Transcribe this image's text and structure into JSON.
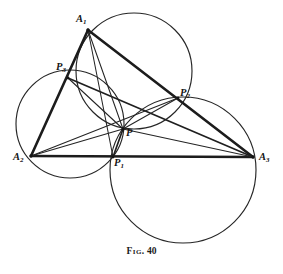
{
  "figure": {
    "caption_prefix": "Fig.",
    "caption_number": "40",
    "kind": "geometric-construction"
  },
  "points": [
    {
      "id": "A1",
      "label": "A",
      "sub": "1",
      "x": 88,
      "y": 30,
      "label_x": 76,
      "label_y": 14,
      "role": "triangle-vertex"
    },
    {
      "id": "A2",
      "label": "A",
      "sub": "2",
      "x": 31,
      "y": 156,
      "label_x": 13,
      "label_y": 152,
      "role": "triangle-vertex"
    },
    {
      "id": "A3",
      "label": "A",
      "sub": "3",
      "x": 253,
      "y": 157,
      "label_x": 259,
      "label_y": 152,
      "role": "triangle-vertex"
    },
    {
      "id": "P1",
      "label": "P",
      "sub": "1",
      "x": 113,
      "y": 157,
      "label_x": 114,
      "label_y": 158,
      "role": "side-point"
    },
    {
      "id": "P2",
      "label": "P",
      "sub": "2",
      "x": 178,
      "y": 98,
      "label_x": 180,
      "label_y": 88,
      "role": "side-point"
    },
    {
      "id": "P3",
      "label": "P",
      "sub": "3",
      "x": 68,
      "y": 78,
      "label_x": 56,
      "label_y": 62,
      "role": "side-point"
    },
    {
      "id": "P",
      "label": "P",
      "sub": "",
      "x": 123,
      "y": 129,
      "label_x": 126,
      "label_y": 128,
      "role": "miquel-point"
    }
  ],
  "circles": [
    {
      "id": "circle-A1P3P2",
      "cx": 134,
      "cy": 71,
      "r": 58,
      "through": [
        "A1",
        "P3",
        "P2",
        "P"
      ]
    },
    {
      "id": "circle-A2P3P1",
      "cx": 70,
      "cy": 124,
      "r": 54,
      "through": [
        "A2",
        "P3",
        "P1",
        "P"
      ]
    },
    {
      "id": "circle-A3P1P2",
      "cx": 183,
      "cy": 170,
      "r": 73,
      "through": [
        "A3",
        "P1",
        "P2",
        "P"
      ]
    }
  ],
  "segments": [
    {
      "id": "side-A1A2",
      "from": "A1",
      "to": "A2",
      "weight": "thick"
    },
    {
      "id": "side-A1A3",
      "from": "A1",
      "to": "A3",
      "weight": "thick"
    },
    {
      "id": "side-A2A3",
      "from": "A2",
      "to": "A3",
      "weight": "thick"
    },
    {
      "id": "cevian-A1P",
      "from": "A1",
      "to": "P",
      "weight": "thin"
    },
    {
      "id": "cevian-A1P1",
      "from": "A1",
      "to": "P1",
      "weight": "thin"
    },
    {
      "id": "cevian-A2P",
      "from": "A2",
      "to": "P",
      "weight": "thin"
    },
    {
      "id": "cevian-A2P2",
      "from": "A2",
      "to": "P2",
      "weight": "thin"
    },
    {
      "id": "cevian-A3P",
      "from": "A3",
      "to": "P",
      "weight": "thin"
    },
    {
      "id": "cevian-A3P3",
      "from": "A3",
      "to": "P3",
      "weight": "med"
    },
    {
      "id": "chord-P3P",
      "from": "P3",
      "to": "P",
      "weight": "thin"
    },
    {
      "id": "chord-P2P",
      "from": "P2",
      "to": "P",
      "weight": "thin"
    },
    {
      "id": "chord-P1P",
      "from": "P1",
      "to": "P",
      "weight": "med"
    }
  ]
}
